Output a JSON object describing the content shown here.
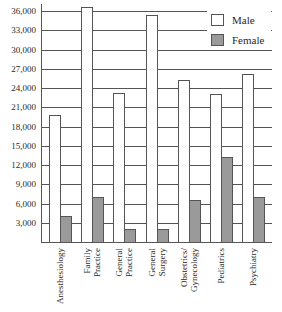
{
  "chart_data": {
    "type": "bar",
    "title": "",
    "xlabel": "",
    "ylabel": "",
    "ylim": [
      0,
      36000
    ],
    "yticks": [
      "3,000",
      "6,000",
      "9,000",
      "12,000",
      "15,000",
      "18,000",
      "21,000",
      "24,000",
      "27,000",
      "30,000",
      "33,000",
      "36,000"
    ],
    "grid": true,
    "legend_position": "upper right",
    "categories": [
      "Anesthesiology",
      "Family Practice",
      "General Practice",
      "General Surgery",
      "Obstetrics/ Gynecology",
      "Pediatrics",
      "Psychiatry"
    ],
    "category_lines": [
      [
        "Anesthesiology"
      ],
      [
        "Family",
        "Practice"
      ],
      [
        "General",
        "Practice"
      ],
      [
        "General",
        "Surgery"
      ],
      [
        "Obstetrics/",
        "Gynecology"
      ],
      [
        "Pediatrics"
      ],
      [
        "Psychiatry"
      ]
    ],
    "series": [
      {
        "name": "Male",
        "color": "#ffffff",
        "values": [
          19800,
          36600,
          23200,
          35300,
          25300,
          23000,
          26200
        ]
      },
      {
        "name": "Female",
        "color": "#9a9a9a",
        "values": [
          4000,
          7000,
          2000,
          2000,
          6500,
          13200,
          7000
        ]
      }
    ]
  },
  "legend": {
    "male_label": "Male",
    "female_label": "Female"
  }
}
